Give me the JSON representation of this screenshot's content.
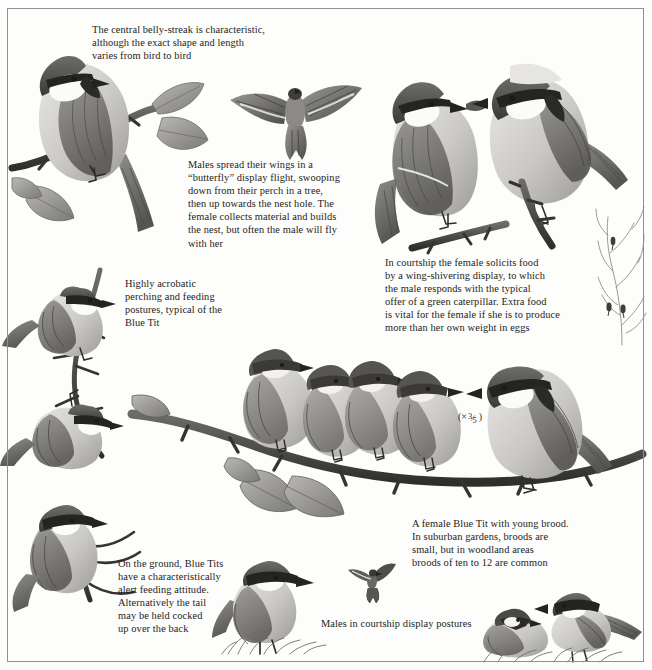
{
  "plate": {
    "subject": "Blue Tit",
    "medium": "graphite illustration plate",
    "background_color": "#fdfdfb",
    "border_color": "#8e9094",
    "ink_color": "#232323"
  },
  "captions": [
    {
      "id": "belly-streak",
      "text": "The central belly-streak is characteristic,\nalthough the exact shape and length\nvaries from bird to bird",
      "x": 92,
      "y": 23,
      "width": 240
    },
    {
      "id": "butterfly-display",
      "text": "Males spread their wings in a\n“butterfly” display flight, swooping\ndown from their perch in a tree,\nthen up towards the nest hole. The\nfemale collects material and builds\nthe nest, but often the male will fly\nwith her",
      "x": 188,
      "y": 158,
      "width": 185
    },
    {
      "id": "courtship-feeding",
      "text": "In courtship the female solicits food\nby a wing-shivering display, to which\nthe male responds with the typical\noffer of a green caterpillar. Extra food\nis vital for the female if she is to produce\nmore than her own weight in eggs",
      "x": 385,
      "y": 256,
      "width": 255
    },
    {
      "id": "acrobatic-postures",
      "text": "Highly acrobatic\nperching and feeding\npostures, typical of the\nBlue Tit",
      "x": 125,
      "y": 277,
      "width": 120
    },
    {
      "id": "female-with-brood",
      "text": "A female Blue Tit with young brood.\nIn suburban gardens, broods are\nsmall, but in woodland areas\nbroods of ten to 12 are common",
      "x": 412,
      "y": 517,
      "width": 210
    },
    {
      "id": "ground-feeding",
      "text": "On the ground, Blue Tits\nhave a characteristically\nalert feeding attitude.\nAlternatively the tail\nmay be held cocked\nup over the back",
      "x": 118,
      "y": 557,
      "width": 135
    },
    {
      "id": "courtship-postures",
      "text": "Males in courtship display postures",
      "x": 321,
      "y": 617,
      "width": 200
    }
  ],
  "scale_note": {
    "prefix": "(×",
    "numerator": "3",
    "slash": "⁄",
    "denominator": "5",
    "suffix": ")",
    "x": 458,
    "y": 411
  },
  "figures": [
    {
      "id": "perched-male-branch-top-left",
      "label": "Blue Tit perched on branch with leaves, upper left",
      "x": 18,
      "y": 20,
      "width": 180,
      "height": 210
    },
    {
      "id": "butterfly-display-flight",
      "label": "Blue Tit in butterfly display flight, wings spread",
      "x": 228,
      "y": 70,
      "width": 130,
      "height": 95
    },
    {
      "id": "male-with-caterpillar",
      "label": "Male Blue Tit holding green caterpillar",
      "x": 378,
      "y": 70,
      "width": 120,
      "height": 185
    },
    {
      "id": "female-wing-shivering",
      "label": "Female Blue Tit soliciting food on branch",
      "x": 478,
      "y": 58,
      "width": 145,
      "height": 185
    },
    {
      "id": "acrobatic-upright",
      "label": "Blue Tit clinging upright to twig",
      "x": 35,
      "y": 268,
      "width": 110,
      "height": 110
    },
    {
      "id": "acrobatic-inverted",
      "label": "Blue Tit hanging upside-down on twig",
      "x": 38,
      "y": 370,
      "width": 110,
      "height": 110
    },
    {
      "id": "brood-fledgling-1",
      "label": "Fledgling Blue Tit, leftmost of brood",
      "x": 238,
      "y": 345,
      "width": 78,
      "height": 100
    },
    {
      "id": "brood-fledgling-2",
      "label": "Fledgling Blue Tit, second of brood",
      "x": 298,
      "y": 360,
      "width": 70,
      "height": 95
    },
    {
      "id": "brood-fledgling-3",
      "label": "Fledgling Blue Tit, third of brood",
      "x": 338,
      "y": 358,
      "width": 72,
      "height": 95
    },
    {
      "id": "brood-fledgling-4",
      "label": "Fledgling Blue Tit, fourth of brood",
      "x": 385,
      "y": 368,
      "width": 72,
      "height": 98
    },
    {
      "id": "adult-female-on-branch",
      "label": "Adult female Blue Tit at right of brood branch",
      "x": 480,
      "y": 355,
      "width": 115,
      "height": 125
    },
    {
      "id": "brood-branch-with-leaves",
      "label": "Long horizontal branch with leaves carrying the brood",
      "x": 140,
      "y": 400,
      "width": 490,
      "height": 110
    },
    {
      "id": "ground-feeding-left",
      "label": "Blue Tit on twig, lower left",
      "x": 25,
      "y": 505,
      "width": 110,
      "height": 110
    },
    {
      "id": "ground-feeding-alert",
      "label": "Blue Tit standing alert on grass",
      "x": 225,
      "y": 565,
      "width": 90,
      "height": 85
    },
    {
      "id": "display-flight-small",
      "label": "Small Blue Tit in flight, centre bottom",
      "x": 348,
      "y": 565,
      "width": 45,
      "height": 35
    },
    {
      "id": "courtship-posture-crouched",
      "label": "Male Blue Tit crouched in courtship display",
      "x": 482,
      "y": 605,
      "width": 65,
      "height": 50
    },
    {
      "id": "courtship-posture-upright",
      "label": "Male Blue Tit upright in courtship display",
      "x": 548,
      "y": 595,
      "width": 90,
      "height": 60
    },
    {
      "id": "winter-twigs",
      "label": "Bare winter twigs with distant birds, right margin",
      "x": 598,
      "y": 210,
      "width": 48,
      "height": 130
    }
  ]
}
